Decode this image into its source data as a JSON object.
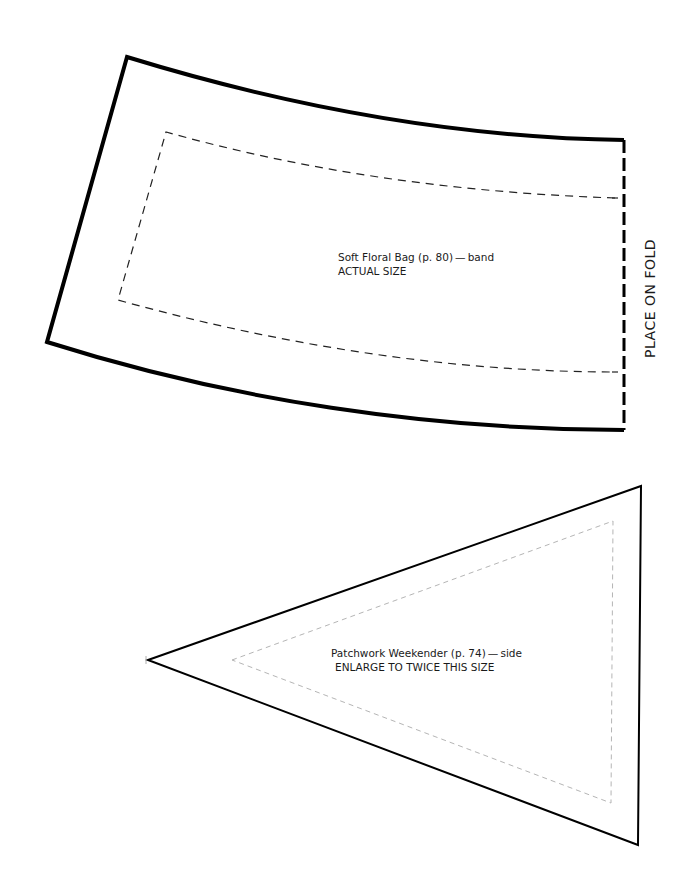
{
  "page": {
    "background": "#ffffff"
  },
  "band_piece": {
    "title": "Soft Floral Bag (p. 80) — band",
    "size_note": "ACTUAL SIZE",
    "fold_label": "PLACE ON FOLD",
    "outline_color": "#000000",
    "seam_color": "#222222"
  },
  "side_piece": {
    "title": "Patchwork Weekender (p. 74) — side",
    "size_note": "ENLARGE TO TWICE THIS SIZE",
    "outline_color": "#000000",
    "seam_color": "#b5b5b5"
  }
}
